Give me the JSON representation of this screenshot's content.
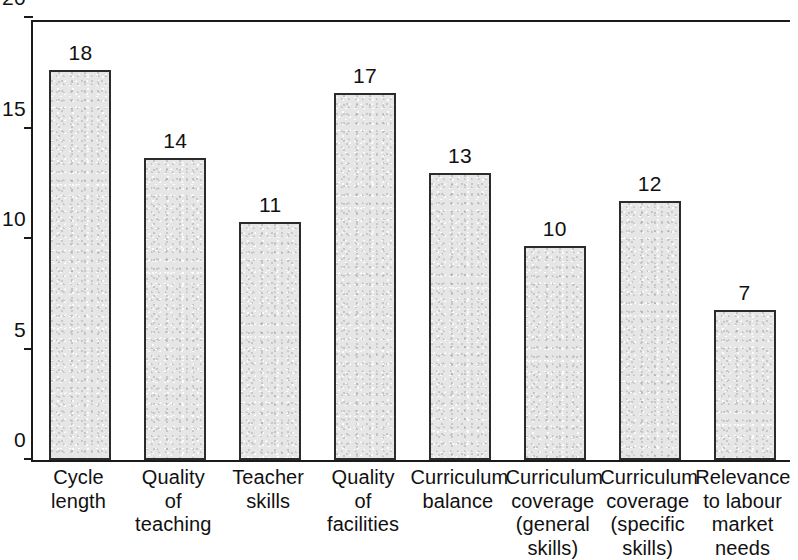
{
  "chart_data": {
    "type": "bar",
    "title": "",
    "subtitle": "",
    "xlabel": "",
    "ylabel": "",
    "ylim": [
      0,
      20
    ],
    "yticks": [
      0,
      5,
      10,
      15,
      20
    ],
    "grid": false,
    "legend": false,
    "categories": [
      "Cycle\nlength",
      "Quality\nof\nteaching",
      "Teacher\nskills",
      "Quality\nof\nfacilities",
      "Curriculum\nbalance",
      "Curriculum\ncoverage\n(general\nskills)",
      "Curriculum\ncoverage\n(specific\nskills)",
      "Relevance\nto labour\nmarket\nneeds"
    ],
    "values": [
      18,
      14,
      11,
      17,
      13,
      10,
      12,
      7
    ],
    "data_labels": [
      "18",
      "14",
      "11",
      "17",
      "13",
      "10",
      "12",
      "7"
    ],
    "bar_fill_color": "#e6e6e6",
    "bar_border_color": "#2b2b2b",
    "axis_color": "#1a1a1a"
  },
  "axis": {
    "y_tick_labels": [
      "20",
      "15",
      "10",
      "5",
      "0"
    ]
  }
}
